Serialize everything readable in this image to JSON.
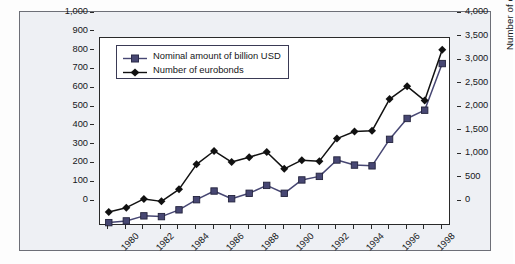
{
  "chart_data": {
    "type": "line",
    "title": "",
    "xlabel": "",
    "ylabel": "Nominal value in billion USD",
    "y2label": "Number of eurobonds",
    "grid": false,
    "legend_position": "top-left",
    "x": [
      1980,
      1981,
      1982,
      1983,
      1984,
      1985,
      1986,
      1987,
      1988,
      1989,
      1990,
      1991,
      1992,
      1993,
      1994,
      1995,
      1996,
      1997,
      1998,
      1999
    ],
    "x_tick_labels": [
      "1980",
      "1982",
      "1984",
      "1986",
      "1988",
      "1990",
      "1992",
      "1994",
      "1996",
      "1998"
    ],
    "ylim": [
      0,
      1000
    ],
    "y_tick_labels": [
      "0",
      "100",
      "200",
      "300",
      "400",
      "500",
      "600",
      "700",
      "800",
      "900",
      "1,000"
    ],
    "y2lim": [
      0,
      4000
    ],
    "y2_tick_labels": [
      "0",
      "500",
      "1,000",
      "1,500",
      "2,000",
      "2,500",
      "3,000",
      "3,500",
      "4,000"
    ],
    "series": [
      {
        "name": "Nominal amount of billion USD",
        "axis": "left",
        "unit": "billion USD",
        "color": "#474773",
        "marker": "square",
        "values": [
          18,
          27,
          54,
          50,
          86,
          140,
          186,
          145,
          174,
          216,
          174,
          245,
          264,
          351,
          324,
          320,
          461,
          572,
          616,
          864
        ]
      },
      {
        "name": "Number of eurobonds",
        "axis": "right",
        "unit": "eurobonds",
        "color": "#111111",
        "marker": "diamond",
        "values": [
          300,
          390,
          576,
          524,
          780,
          1312,
          1596,
          1360,
          1464,
          1576,
          1216,
          1400,
          1380,
          1860,
          2012,
          2024,
          2700,
          2972,
          2668,
          3752
        ]
      }
    ]
  },
  "axes": {
    "left_title": "Nominal value in billion USD",
    "right_title": "Number of eurobonds"
  },
  "legend": {
    "items": [
      {
        "label": "Nominal amount of billion USD",
        "marker": "square-marker",
        "color": "#474773"
      },
      {
        "label": "Number of eurobonds",
        "marker": "diamond-marker",
        "color": "#111111"
      }
    ]
  }
}
